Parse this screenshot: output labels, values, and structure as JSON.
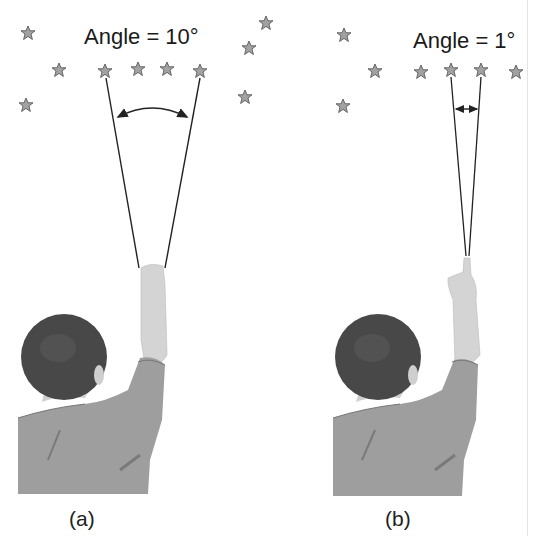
{
  "panels": [
    {
      "id": "a",
      "caption": "(a)",
      "angle_label": "Angle = 10°",
      "angle_degrees": 10,
      "arrow": "curved-double-arrow"
    },
    {
      "id": "b",
      "caption": "(b)",
      "angle_label": "Angle = 1°",
      "angle_degrees": 1,
      "arrow": "straight-double-arrow"
    }
  ],
  "colors": {
    "star_fill": "#9a9a9a",
    "star_stroke": "#555555",
    "line": "#222222",
    "hair": "#4a4a4a",
    "shirt": "#9c9c9c",
    "skin": "#d8d8d8"
  }
}
